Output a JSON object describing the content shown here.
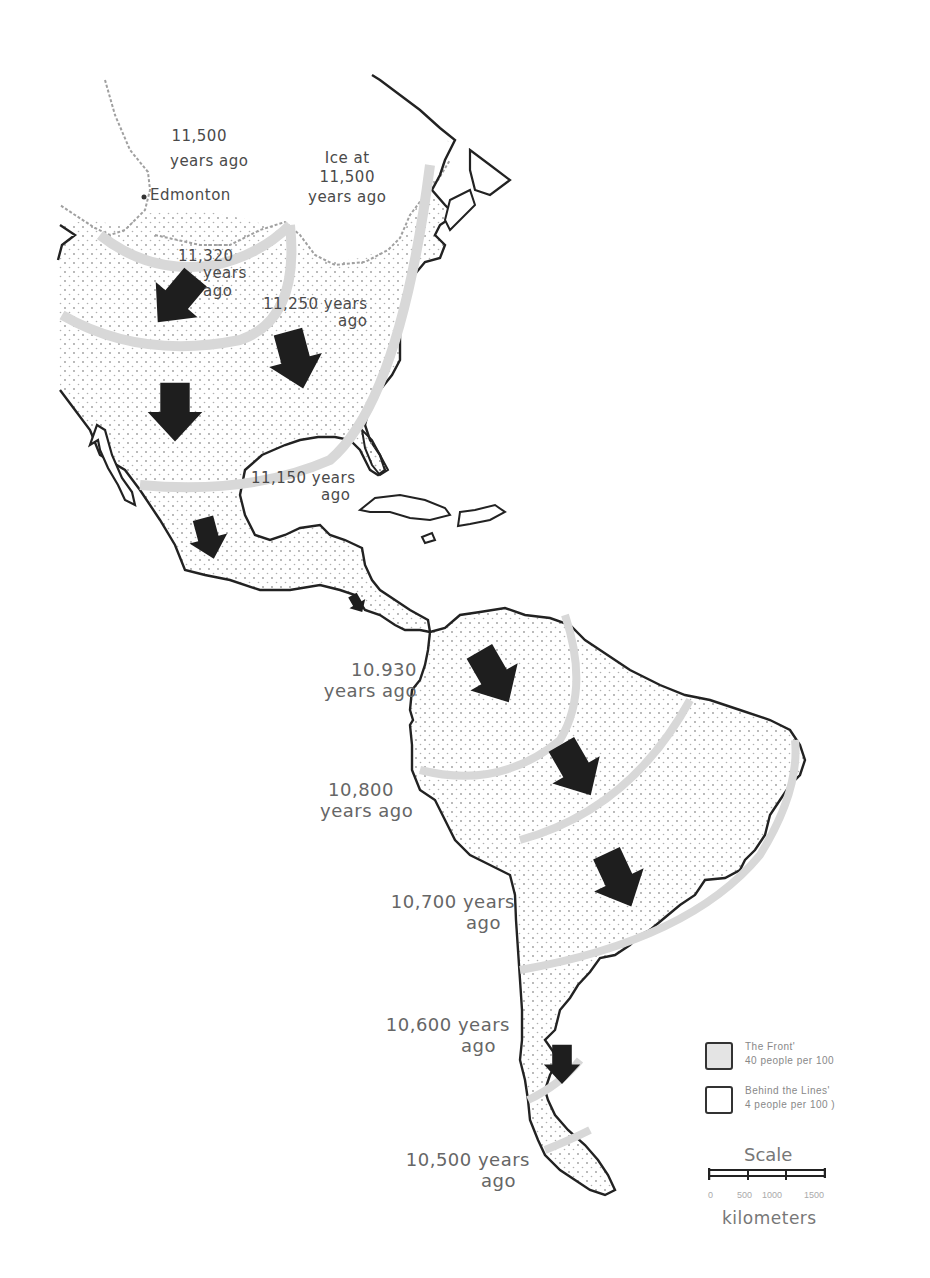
{
  "map": {
    "title": "",
    "subject": "Paleo-Indian migration front across the Americas",
    "colors": {
      "coastline": "#222222",
      "front_band": "#e0e0e0",
      "ice_edge": "#9a9a9a",
      "arrow": "#1a1a1a",
      "stipple": "#9a9a9a"
    },
    "places": [
      {
        "name": "Edmonton",
        "marker": "dot"
      }
    ],
    "time_labels": [
      {
        "id": "t11500_west",
        "line1": "11,500",
        "line2": "years ago"
      },
      {
        "id": "t11500_ice",
        "line0": "Ice at",
        "line1": "11,500",
        "line2": "years ago"
      },
      {
        "id": "t11320",
        "line1": "11,320",
        "line2": "years",
        "line3": "ago"
      },
      {
        "id": "t11250",
        "line1": "11,250 years",
        "line2": "ago"
      },
      {
        "id": "t11150",
        "line1": "11,150 years",
        "line2": "ago"
      },
      {
        "id": "t10930",
        "line1": "10.930",
        "line2": "years ago"
      },
      {
        "id": "t10800",
        "line1": "10,800",
        "line2": "years ago"
      },
      {
        "id": "t10700",
        "line1": "10,700 years",
        "line2": "ago"
      },
      {
        "id": "t10600",
        "line1": "10,600 years",
        "line2": "ago"
      },
      {
        "id": "t10500",
        "line1": "10,500 years",
        "line2": "ago"
      }
    ],
    "arrows_count": 10,
    "legend": {
      "items": [
        {
          "swatch": "front",
          "line1": "The Front'",
          "line2": "40 people per 100"
        },
        {
          "swatch": "behind",
          "line1": "Behind the Lines'",
          "line2": "4 people per 100 )"
        }
      ]
    },
    "scale": {
      "title": "Scale",
      "ticks": [
        "0",
        "500",
        "1000",
        "1500"
      ],
      "unit": "kilometers"
    }
  }
}
